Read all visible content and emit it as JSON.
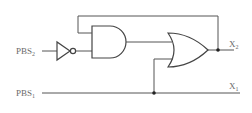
{
  "diagram": {
    "type": "logic-circuit",
    "inputs": [
      {
        "id": "pbs2",
        "label": "PBS",
        "subscript": "2"
      },
      {
        "id": "pbs1",
        "label": "PBS",
        "subscript": "1"
      }
    ],
    "outputs": [
      {
        "id": "x2",
        "label": "X",
        "subscript": "2"
      },
      {
        "id": "x1",
        "label": "X",
        "subscript": "1"
      }
    ],
    "gates": [
      {
        "id": "not1",
        "type": "NOT",
        "input": "pbs2"
      },
      {
        "id": "and1",
        "type": "AND",
        "inputs": [
          "x2-feedback",
          "not1"
        ]
      },
      {
        "id": "or1",
        "type": "OR",
        "inputs": [
          "and1",
          "pbs1"
        ],
        "output": "x2"
      }
    ],
    "colors": {
      "wire": "#555555",
      "gate": "#444444",
      "label": "#6a6a6a"
    }
  }
}
